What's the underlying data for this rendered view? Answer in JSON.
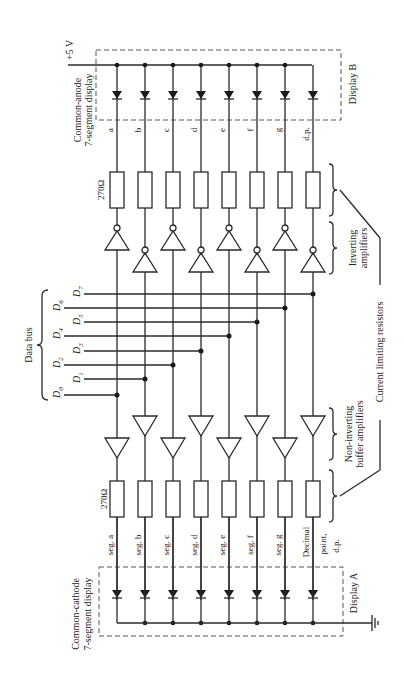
{
  "figure": {
    "supply_label": "+5 V",
    "ground_label": "ground",
    "data_bus_label": "Data bus",
    "bus_lines": [
      "D0",
      "D1",
      "D2",
      "D3",
      "D4",
      "D5",
      "D6",
      "D7"
    ],
    "resistor_value": "270Ω",
    "display_a": {
      "name": "Display A",
      "type": "Common-cathode 7-segment display",
      "type_line1": "Common-cathode",
      "type_line2": "7-segment display",
      "segments": [
        "seg. a",
        "seg. b",
        "seg. c",
        "seg. d",
        "seg. e",
        "seg. f",
        "seg. g",
        "Decimal point, d.p."
      ],
      "dp_line1": "Decimal",
      "dp_line2": "point,",
      "dp_line3": "d.p."
    },
    "display_b": {
      "name": "Display B",
      "type": "Common-anode 7-segment display",
      "type_line1": "Common-anode",
      "type_line2": "7-segment display",
      "segments": [
        "a",
        "b",
        "c",
        "d",
        "e",
        "f",
        "g",
        "d.p."
      ]
    },
    "annotations": {
      "non_inverting_line1": "Non-inverting",
      "non_inverting_line2": "buffer amplifiers",
      "inverting_line1": "Inverting",
      "inverting_line2": "amplifiers",
      "current_limiting": "Current limiting resistors"
    }
  }
}
